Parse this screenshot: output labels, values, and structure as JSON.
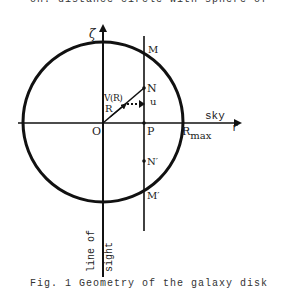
{
  "captions": {
    "top_clipped": "on. distance circle with sphere of",
    "bottom_clipped": "Fig. 1 Geometry of the galaxy disk"
  },
  "diagram": {
    "labels": {
      "zeta": "ζ",
      "M": "M",
      "N": "N",
      "V_R": "V(R)",
      "R": "R",
      "u": "u",
      "O": "O",
      "P": "P",
      "sky": "sky",
      "r": "r",
      "R_max_base": "R",
      "R_max_sub": "max",
      "N_prime": "N′",
      "M_prime": "M′",
      "line_of": "line of",
      "sight": "sight"
    },
    "circle": {
      "cx": 103,
      "cy": 122,
      "r": 80
    },
    "colors": {
      "ink": "#111111"
    }
  }
}
